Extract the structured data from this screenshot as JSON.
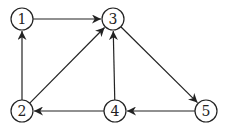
{
  "graph": {
    "type": "directed",
    "nodes": [
      {
        "id": "1",
        "label": "1",
        "x": 22,
        "y": 19
      },
      {
        "id": "2",
        "label": "2",
        "x": 22,
        "y": 111
      },
      {
        "id": "3",
        "label": "3",
        "x": 113,
        "y": 19
      },
      {
        "id": "4",
        "label": "4",
        "x": 115,
        "y": 111
      },
      {
        "id": "5",
        "label": "5",
        "x": 206,
        "y": 111
      }
    ],
    "edges": [
      {
        "from": "1",
        "to": "3"
      },
      {
        "from": "2",
        "to": "1"
      },
      {
        "from": "2",
        "to": "3"
      },
      {
        "from": "4",
        "to": "3"
      },
      {
        "from": "4",
        "to": "2"
      },
      {
        "from": "3",
        "to": "5"
      },
      {
        "from": "5",
        "to": "4"
      }
    ]
  }
}
